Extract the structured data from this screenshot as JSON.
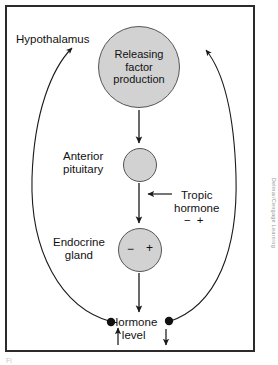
{
  "figure": {
    "credit": "Delmar/Cengage Learning",
    "caption_fragment": "Fi"
  },
  "nodes": {
    "releasing_factor": {
      "line1": "Releasing",
      "line2": "factor",
      "line3": "production",
      "arrow_left": "↓",
      "arrow_right": "↑"
    },
    "anterior_pituitary": {
      "line1": "Anterior",
      "line2": "pituitary",
      "arrow_left": "↓",
      "arrow_right": "↑"
    },
    "endocrine_gland": {
      "line1": "Endocrine",
      "line2": "gland",
      "sign_left": "−",
      "sign_right": "+"
    }
  },
  "labels": {
    "hypothalamus": "Hypothalamus",
    "tropic_hormone_line1": "Tropic",
    "tropic_hormone_line2": "hormone",
    "tropic_sign_minus": "−",
    "tropic_sign_plus": "+",
    "hormone_level_line1": "Hormone",
    "hormone_level_line2": "level",
    "hormone_arrow_up": "↑",
    "hormone_arrow_down": "↓"
  },
  "colors": {
    "circle_fill": "#d2d2d2",
    "circle_stroke": "#555555",
    "frame_border": "#2b2b2b",
    "line_stroke": "#1a1a1a",
    "text": "#111111",
    "credit_text": "#9a9a9a",
    "background": "#ffffff"
  }
}
